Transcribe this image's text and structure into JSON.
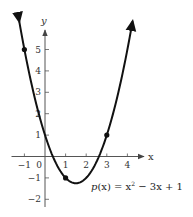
{
  "chart_data": {
    "type": "line",
    "title": "",
    "function": "p(x) = x^2 - 3x + 1",
    "equation_label": "p(x) = x² − 3x + 1",
    "xlabel": "x",
    "ylabel": "y",
    "xlim": [
      -1.6,
      4.7
    ],
    "ylim": [
      -2.3,
      6.2
    ],
    "x_ticks": [
      -1,
      0,
      1,
      2,
      3,
      4
    ],
    "x_tick_labels": [
      "−1",
      "0",
      "1",
      "2",
      "3",
      "4"
    ],
    "y_ticks": [
      -2,
      -1,
      1,
      2,
      3,
      4,
      5
    ],
    "y_tick_labels": [
      "−2",
      "−1",
      "1",
      "2",
      "3",
      "4",
      "5"
    ],
    "grid": false,
    "legend": "none",
    "series": [
      {
        "name": "p(x) = x² − 3x + 1",
        "x": [
          -1.25,
          -1,
          0,
          1,
          1.5,
          2,
          3,
          4,
          4.25
        ],
        "y": [
          6.31,
          5,
          1,
          -1,
          -1.25,
          -1,
          1,
          5,
          6.31
        ]
      }
    ],
    "marked_points": [
      {
        "x": -1,
        "y": 5
      },
      {
        "x": 1,
        "y": -1
      },
      {
        "x": 3,
        "y": 1
      }
    ],
    "vertex": {
      "x": 1.5,
      "y": -1.25
    },
    "colors": {
      "curve": "#111111",
      "axes": "#555555",
      "text": "#333333"
    }
  }
}
